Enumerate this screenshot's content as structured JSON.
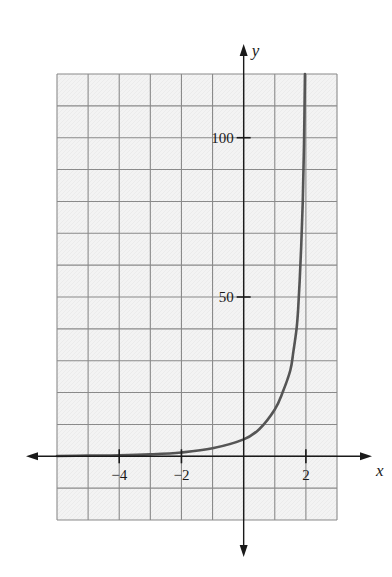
{
  "chart_data": {
    "type": "line",
    "title": "",
    "xlabel": "x",
    "ylabel": "y",
    "xlim": [
      -6,
      3
    ],
    "ylim": [
      -20,
      120
    ],
    "grid": true,
    "grid_step": {
      "x": 1,
      "y": 10
    },
    "x_ticks": [
      {
        "value": -4,
        "label": "−4"
      },
      {
        "value": -2,
        "label": "−2"
      },
      {
        "value": 2,
        "label": "2"
      }
    ],
    "y_ticks": [
      {
        "value": 50,
        "label": "50"
      },
      {
        "value": 100,
        "label": "100"
      }
    ],
    "series": [
      {
        "name": "f(x)",
        "color": "#555555",
        "x": [
          -6,
          -5,
          -4,
          -3,
          -2,
          -1,
          0,
          0.5,
          1,
          1.25,
          1.5,
          1.6,
          1.7,
          1.75,
          1.8,
          1.85,
          1.9,
          1.94,
          1.97
        ],
        "y": [
          0.1,
          0.2,
          0.3,
          0.6,
          1.2,
          2.5,
          5.3,
          8.5,
          14.7,
          20,
          27,
          33,
          40,
          46,
          55,
          66,
          80,
          98,
          120
        ]
      }
    ],
    "legend": null
  },
  "colors": {
    "grid_fill": "#f4f4f4",
    "grid_line": "#8a8a8a",
    "axis": "#1a1a1a",
    "curve": "#555555"
  }
}
